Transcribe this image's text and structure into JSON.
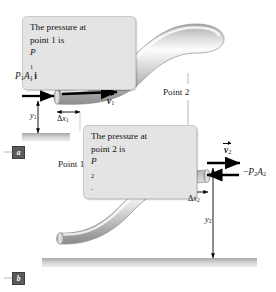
{
  "figure": {
    "title_desc": "Bernoulli equation fluid flow through a pipe at two points",
    "colors": {
      "pipe_light": "#f2f2f2",
      "pipe_mid": "#c8c8c8",
      "pipe_dark": "#9a9a9a",
      "callout_bg": "#e4e4e4",
      "callout_border": "#c9c9c9",
      "ground": "#bdbdbd",
      "arrow": "#000000",
      "leader": "#9a9a9a"
    }
  },
  "callouts": {
    "point1": {
      "line1": "The pressure at",
      "line2_pre": "point 1 is ",
      "line2_sym": "P",
      "line2_sub": "1",
      "line2_post": "."
    },
    "point2": {
      "line1": "The pressure at",
      "line2_pre": "point 2 is ",
      "line2_sym": "P",
      "line2_sub": "2",
      "line2_post": "."
    }
  },
  "labels": {
    "force1": {
      "p": "P",
      "p_sub": "1",
      "a": "A",
      "a_sub": "1",
      "unit": "i"
    },
    "force2": {
      "minus": "−",
      "p": "P",
      "p_sub": "2",
      "a": "A",
      "a_sub": "2"
    },
    "velocity1": {
      "sym": "v",
      "sub": "1"
    },
    "velocity2": {
      "sym": "v",
      "sub": "2"
    },
    "height1": {
      "sym": "y",
      "sub": "1"
    },
    "height2": {
      "sym": "y",
      "sub": "2"
    },
    "dx1": {
      "delta": "Δ",
      "sym": "x",
      "sub": "1"
    },
    "dx2": {
      "delta": "Δ",
      "sym": "x",
      "sub": "2"
    },
    "point1_text": "Point 1",
    "point2_text": "Point 2"
  },
  "panels": {
    "a": "a",
    "b": "b"
  }
}
